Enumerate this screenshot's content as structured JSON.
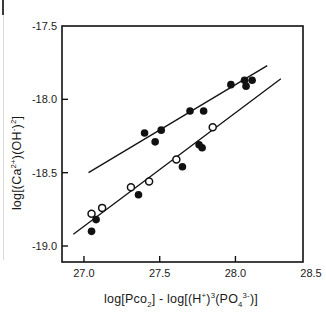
{
  "page": {
    "background": "#ffffff"
  },
  "chart_data": {
    "type": "scatter",
    "title": "",
    "xlabel": "log[Pco2] - log[(H+)3(PO4 3-)]",
    "ylabel": "log[(Ca2+)(OH-)2]",
    "xlabel_parts": [
      {
        "t": "log[Pco"
      },
      {
        "t": "2",
        "s": "sub"
      },
      {
        "t": "] - log[(H"
      },
      {
        "t": "+",
        "s": "sup"
      },
      {
        "t": ")"
      },
      {
        "t": "3",
        "s": "sup"
      },
      {
        "t": "(PO"
      },
      {
        "t": "4",
        "s": "sub"
      },
      {
        "t": "3-",
        "s": "sup"
      },
      {
        "t": ")]"
      }
    ],
    "ylabel_parts": [
      {
        "t": "log[(Ca"
      },
      {
        "t": "2+",
        "s": "sup"
      },
      {
        "t": ")(OH"
      },
      {
        "t": "-",
        "s": "sup"
      },
      {
        "t": ")"
      },
      {
        "t": "2",
        "s": "sup"
      },
      {
        "t": "]"
      }
    ],
    "xlim": [
      26.855,
      28.446
    ],
    "ylim": [
      -19.109,
      -17.5
    ],
    "xticks": [
      {
        "v": 27.0,
        "label": "27.0"
      },
      {
        "v": 27.5,
        "label": "27.5"
      },
      {
        "v": 28.0,
        "label": "28.0"
      },
      {
        "v": 28.5,
        "label": "28.5"
      }
    ],
    "yticks": [
      {
        "v": -17.5,
        "label": "-17.5"
      },
      {
        "v": -18.0,
        "label": "-18.0"
      },
      {
        "v": -18.5,
        "label": "-18.5"
      },
      {
        "v": -19.0,
        "label": "-19.0"
      }
    ],
    "grid": false,
    "legend": "none",
    "colors": {
      "marker": "#111111",
      "line": "#111111",
      "frame": "#111111",
      "open_marker_fill": "#ffffff"
    },
    "series": [
      {
        "name": "filled-circles-upper",
        "marker": "filled",
        "points": [
          [
            27.4,
            -18.23
          ],
          [
            27.47,
            -18.29
          ],
          [
            27.51,
            -18.21
          ],
          [
            27.7,
            -18.08
          ],
          [
            27.79,
            -18.08
          ],
          [
            27.97,
            -17.9
          ],
          [
            28.06,
            -17.87
          ],
          [
            28.07,
            -17.91
          ],
          [
            28.11,
            -17.87
          ]
        ]
      },
      {
        "name": "filled-circles-lower",
        "marker": "filled",
        "points": [
          [
            27.05,
            -18.9
          ],
          [
            27.08,
            -18.82
          ],
          [
            27.36,
            -18.65
          ],
          [
            27.65,
            -18.46
          ],
          [
            27.76,
            -18.31
          ],
          [
            27.78,
            -18.33
          ]
        ]
      },
      {
        "name": "open-circles",
        "marker": "open",
        "points": [
          [
            27.05,
            -18.78
          ],
          [
            27.12,
            -18.74
          ],
          [
            27.31,
            -18.6
          ],
          [
            27.43,
            -18.56
          ],
          [
            27.61,
            -18.41
          ],
          [
            27.85,
            -18.19
          ]
        ]
      }
    ],
    "lines": [
      {
        "name": "upper-trend-line",
        "x1": 27.03,
        "y1": -18.5,
        "x2": 28.21,
        "y2": -17.77
      },
      {
        "name": "lower-trend-line",
        "x1": 26.93,
        "y1": -18.92,
        "x2": 28.3,
        "y2": -17.86
      }
    ]
  }
}
